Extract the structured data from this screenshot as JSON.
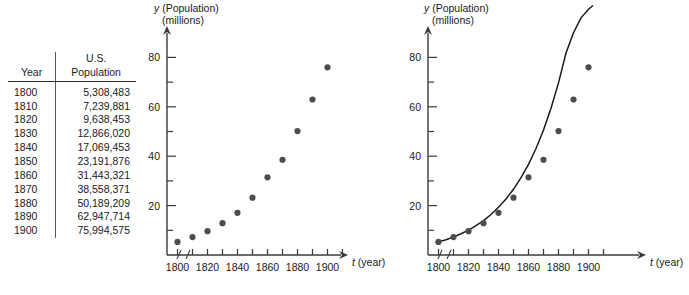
{
  "table": {
    "headers": {
      "year": "Year",
      "population": "U.S.\nPopulation",
      "population_line1": "U.S.",
      "population_line2": "Population"
    },
    "rows": [
      {
        "year": "1800",
        "population": "5,308,483"
      },
      {
        "year": "1810",
        "population": "7,239,881"
      },
      {
        "year": "1820",
        "population": "9,638,453"
      },
      {
        "year": "1830",
        "population": "12,866,020"
      },
      {
        "year": "1840",
        "population": "17,069,453"
      },
      {
        "year": "1850",
        "population": "23,191,876"
      },
      {
        "year": "1860",
        "population": "31,443,321"
      },
      {
        "year": "1870",
        "population": "38,558,371"
      },
      {
        "year": "1880",
        "population": "50,189,209"
      },
      {
        "year": "1890",
        "population": "62,947,714"
      },
      {
        "year": "1900",
        "population": "75,994,575"
      }
    ]
  },
  "chart_data": [
    {
      "id": "scatter-plot",
      "type": "scatter",
      "title": "",
      "xlabel": "t (year)",
      "ylabel": "y (Population) (millions)",
      "ylabel_line1": "y (Population)",
      "ylabel_line2": "(millions)",
      "xlabel_symbol": "t",
      "xlabel_unit": "(year)",
      "ylabel_symbol": "y",
      "x": [
        1800,
        1810,
        1820,
        1830,
        1840,
        1850,
        1860,
        1870,
        1880,
        1890,
        1900
      ],
      "values": [
        5.31,
        7.24,
        9.64,
        12.87,
        17.07,
        23.19,
        31.44,
        38.56,
        50.19,
        62.95,
        75.99
      ],
      "xticks": [
        1800,
        1810,
        1820,
        1830,
        1840,
        1850,
        1860,
        1870,
        1880,
        1890,
        1900,
        1910
      ],
      "xticklabels": [
        "1800",
        "",
        "1820",
        "",
        "1840",
        "",
        "1860",
        "",
        "1880",
        "",
        "1900",
        ""
      ],
      "yticks": [
        10,
        20,
        30,
        40,
        50,
        60,
        70,
        80
      ],
      "yticklabels": [
        "",
        "20",
        "",
        "40",
        "",
        "60",
        "",
        "80"
      ],
      "xlim": [
        1793,
        1913
      ],
      "ylim": [
        0,
        86
      ],
      "grid": false,
      "legend": "none",
      "axis_break": true,
      "marker_color": "#4d4d4d",
      "has_fit_curve": false
    },
    {
      "id": "scatter-with-exponential-fit",
      "type": "scatter",
      "title": "",
      "xlabel": "t (year)",
      "ylabel": "y (Population) (millions)",
      "ylabel_line1": "y (Population)",
      "ylabel_line2": "(millions)",
      "xlabel_symbol": "t",
      "xlabel_unit": "(year)",
      "ylabel_symbol": "y",
      "x": [
        1800,
        1810,
        1820,
        1830,
        1840,
        1850,
        1860,
        1870,
        1880,
        1890,
        1900
      ],
      "values": [
        5.31,
        7.24,
        9.64,
        12.87,
        17.07,
        23.19,
        31.44,
        38.56,
        50.19,
        62.95,
        75.99
      ],
      "xticks": [
        1800,
        1810,
        1820,
        1830,
        1840,
        1850,
        1860,
        1870,
        1880,
        1890,
        1900,
        1910
      ],
      "xticklabels": [
        "1800",
        "",
        "1820",
        "",
        "1840",
        "",
        "1860",
        "",
        "1880",
        "",
        "1900",
        ""
      ],
      "yticks": [
        10,
        20,
        30,
        40,
        50,
        60,
        70,
        80
      ],
      "yticklabels": [
        "",
        "20",
        "",
        "40",
        "",
        "60",
        "",
        "80"
      ],
      "xlim": [
        1793,
        1913
      ],
      "ylim": [
        0,
        86
      ],
      "grid": false,
      "legend": "none",
      "axis_break": true,
      "marker_color": "#4d4d4d",
      "has_fit_curve": true,
      "fit_curve": {
        "type": "exponential",
        "label": "",
        "color": "#1a1a1a",
        "x_start": 1798,
        "x_end": 1903,
        "points_x": [
          1798,
          1805,
          1810,
          1815,
          1820,
          1825,
          1830,
          1835,
          1840,
          1845,
          1850,
          1855,
          1860,
          1865,
          1870,
          1875,
          1880,
          1885,
          1890,
          1895,
          1900,
          1903
        ],
        "points_y": [
          5.0,
          6.2,
          7.3,
          8.6,
          10.1,
          11.9,
          13.9,
          16.4,
          19.3,
          22.7,
          26.6,
          31.3,
          36.7,
          43.1,
          50.6,
          59.4,
          69.7,
          81.8,
          90.0,
          96.0,
          99.5,
          101.0
        ]
      }
    }
  ],
  "captions": {
    "a": "",
    "b": ""
  }
}
